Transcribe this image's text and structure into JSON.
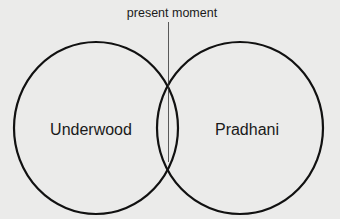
{
  "diagram": {
    "type": "venn",
    "annotation": {
      "label": "present moment"
    },
    "sets": [
      {
        "label": "Underwood"
      },
      {
        "label": "Pradhani"
      }
    ],
    "colors": {
      "background": "#ebebea",
      "stroke": "#111111",
      "text": "#1a1a1a"
    }
  }
}
